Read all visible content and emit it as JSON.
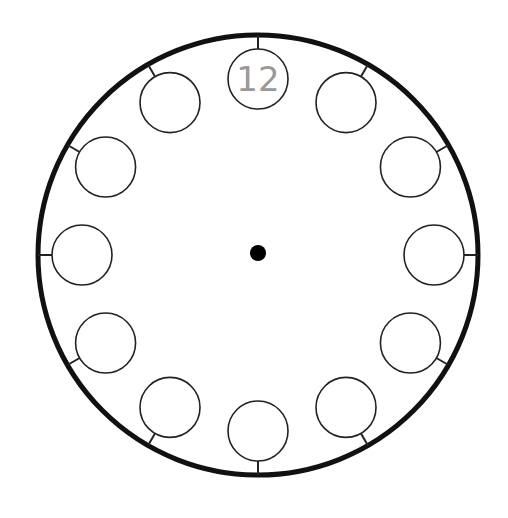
{
  "diagram": {
    "outer_circle": {
      "cx": 258,
      "cy": 255,
      "r": 220,
      "stroke": "#111111",
      "stroke_width": 5
    },
    "center_dot": {
      "cx": 258,
      "cy": 253,
      "r": 8,
      "fill": "#000000"
    },
    "hour_circles": {
      "radius": 30,
      "distance": 176,
      "tick_color": "#222222",
      "labels": [
        "12",
        "",
        "",
        "",
        "",
        "",
        "",
        "",
        "",
        "",
        "",
        ""
      ]
    },
    "numeral_color": "#999999"
  }
}
